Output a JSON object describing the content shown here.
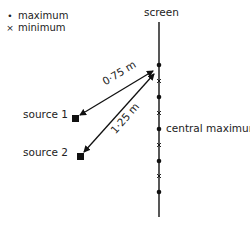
{
  "legend": {
    "items": [
      {
        "symbol": "•",
        "label": "maximum",
        "icon": "dot-icon"
      },
      {
        "symbol": "×",
        "label": "minimum",
        "icon": "cross-icon"
      }
    ]
  },
  "labels": {
    "screen": "screen",
    "source1": "source 1",
    "source2": "source 2",
    "central_maximum": "central maximum",
    "distance1": "0·75 m",
    "distance2": "1·25 m"
  },
  "colors": {
    "ink": "#111111",
    "text": "#222222"
  }
}
